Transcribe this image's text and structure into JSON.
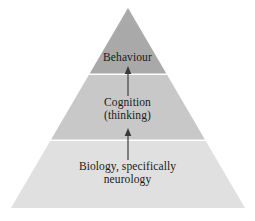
{
  "diagram": {
    "type": "pyramid",
    "title": "",
    "background_color": "#ffffff",
    "text_color": "#1a1a1a",
    "apex": {
      "x": 128,
      "y": 8
    },
    "base_left": {
      "x": 11,
      "y": 208
    },
    "base_right": {
      "x": 245,
      "y": 208
    },
    "divider_color": "#ffffff",
    "tiers": [
      {
        "id": "behaviour",
        "level": 3,
        "position": "top",
        "fill_color": "#a9a9a9",
        "top_y": 8,
        "bottom_y": 75,
        "lines": [
          "Behaviour"
        ]
      },
      {
        "id": "cognition",
        "level": 2,
        "position": "middle",
        "fill_color": "#c8c8c8",
        "top_y": 75,
        "bottom_y": 141,
        "lines": [
          "Cognition",
          "(thinking)"
        ]
      },
      {
        "id": "biology",
        "level": 1,
        "position": "bottom",
        "fill_color": "#e0e0e0",
        "top_y": 141,
        "bottom_y": 208,
        "lines": [
          "Biology, specifically",
          "neurology"
        ]
      }
    ],
    "arrows": [
      {
        "id": "arrow-cognition-to-behaviour",
        "direction": "up",
        "color": "#4a4a4a",
        "x": 128,
        "tail_y": 96,
        "head_y": 66
      },
      {
        "id": "arrow-biology-to-cognition",
        "direction": "up",
        "color": "#4a4a4a",
        "x": 128,
        "tail_y": 160,
        "head_y": 128
      }
    ]
  },
  "labels": {
    "behaviour": {
      "line1": "Behaviour"
    },
    "cognition": {
      "line1": "Cognition",
      "line2": "(thinking)"
    },
    "biology": {
      "line1": "Biology, specifically",
      "line2": "neurology"
    }
  }
}
